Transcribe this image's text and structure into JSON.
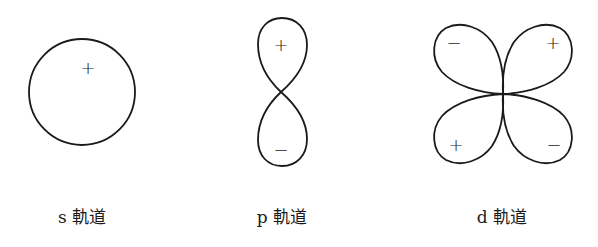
{
  "diagram": {
    "orbitals": [
      {
        "id": "s",
        "label": "s 軌道",
        "shape": "sphere (circle)",
        "signs": [
          {
            "text": "+",
            "x": 88,
            "y": 68
          }
        ]
      },
      {
        "id": "p",
        "label": "p 軌道",
        "shape": "dumbbell (two vertical lobes)",
        "signs": [
          {
            "text": "+",
            "x": 281,
            "y": 45
          },
          {
            "text": "−",
            "x": 281,
            "y": 150
          }
        ]
      },
      {
        "id": "d",
        "label": "d 軌道",
        "shape": "cloverleaf (four diagonal lobes)",
        "signs": [
          {
            "text": "−",
            "x": 454,
            "y": 43
          },
          {
            "text": "+",
            "x": 553,
            "y": 43
          },
          {
            "text": "+",
            "x": 456,
            "y": 145
          },
          {
            "text": "−",
            "x": 554,
            "y": 145
          }
        ]
      }
    ],
    "stroke_color": "#1a1a1a",
    "background": "#ffffff"
  }
}
